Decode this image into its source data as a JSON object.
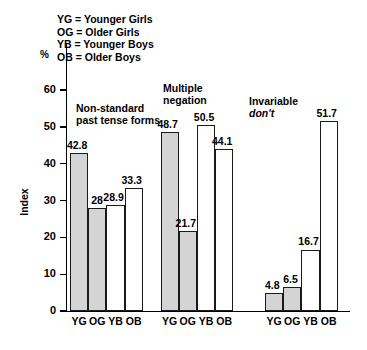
{
  "chart_data": {
    "type": "bar",
    "title": "",
    "xlabel": "",
    "ylabel": "Index",
    "unit_label": "%",
    "ylim": [
      0,
      60
    ],
    "yticks": [
      0,
      10,
      20,
      30,
      40,
      50,
      60
    ],
    "ytick_labels": [
      "0",
      "10",
      "20",
      "30",
      "40",
      "50",
      "60"
    ],
    "grid": false,
    "legend_position": "top-left",
    "legend": [
      {
        "key": "YG",
        "label": "YG = Younger Girls"
      },
      {
        "key": "OG",
        "label": "OG = Older Girls"
      },
      {
        "key": "YB",
        "label": "YB = Younger Boys"
      },
      {
        "key": "OB",
        "label": "OB = Older Boys"
      }
    ],
    "categories": [
      "YG",
      "OG",
      "YB",
      "OB"
    ],
    "groups": [
      {
        "title": "Non-standard past tense forms",
        "title_line1": "Non-standard",
        "title_line2": "past tense forms",
        "title_italic_line": "",
        "values": [
          42.8,
          28,
          28.9,
          33.3
        ],
        "value_labels": [
          "42.8",
          "28",
          "28.9",
          "33.3"
        ],
        "fills": [
          "filled",
          "filled",
          "hollow",
          "hollow"
        ]
      },
      {
        "title": "Multiple negation",
        "title_line1": "Multiple",
        "title_line2": "negation",
        "title_italic_line": "",
        "values": [
          48.7,
          21.7,
          50.5,
          44.1
        ],
        "value_labels": [
          "48.7",
          "21.7",
          "50.5",
          "44.1"
        ],
        "fills": [
          "filled",
          "filled",
          "hollow",
          "hollow"
        ]
      },
      {
        "title": "Invariable don't",
        "title_line1": "Invariable",
        "title_line2": "",
        "title_italic_line": "don't",
        "values": [
          4.8,
          6.5,
          16.7,
          51.7
        ],
        "value_labels": [
          "4.8",
          "6.5",
          "16.7",
          "51.7"
        ],
        "fills": [
          "filled",
          "filled",
          "hollow",
          "hollow"
        ]
      }
    ],
    "colors": {
      "filled_bar": "#d4d4d4",
      "hollow_bar": "#ffffff",
      "bar_outline": "#1a1a1a",
      "axis": "#000000",
      "text": "#000000"
    }
  }
}
